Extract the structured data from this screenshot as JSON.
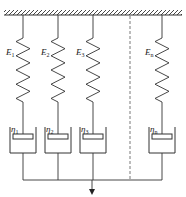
{
  "diagram": {
    "colors": {
      "line": "#333333",
      "dash": "#555555",
      "background": "#ffffff"
    },
    "branches": [
      {
        "spring_label": "E",
        "spring_sub": "1",
        "dashpot_label": "η",
        "dashpot_sub": "1",
        "x": 23
      },
      {
        "spring_label": "E",
        "spring_sub": "2",
        "dashpot_label": "η",
        "dashpot_sub": "2",
        "x": 58
      },
      {
        "spring_label": "E",
        "spring_sub": "3",
        "dashpot_label": "η",
        "dashpot_sub": "3",
        "x": 93
      },
      {
        "spring_label": "E",
        "spring_sub": "n",
        "dashpot_label": "η",
        "dashpot_sub": "n",
        "x": 162
      }
    ],
    "ellipsis_divider": "dashed-line",
    "load_arrow": "down"
  }
}
